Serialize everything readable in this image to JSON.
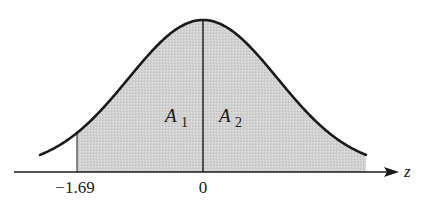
{
  "chart_data": {
    "type": "area",
    "title": "",
    "xlabel": "z",
    "ylabel": "",
    "x_ticks": [
      {
        "value": -1.69,
        "label": "−1.69"
      },
      {
        "value": 0,
        "label": "0"
      }
    ],
    "shaded_from": -1.69,
    "shaded_to": "right tail",
    "divider_at": 0,
    "regions": [
      {
        "name": "A1",
        "label_main": "A",
        "label_sub": "1",
        "from": -1.69,
        "to": 0
      },
      {
        "name": "A2",
        "label_main": "A",
        "label_sub": "2",
        "from": 0,
        "to": "right tail"
      }
    ],
    "axis_arrow": true,
    "grid": false,
    "legend": false,
    "colors": {
      "curve": "#1a1a1a",
      "shade": "#cfcfcf",
      "axis": "#1a1a1a"
    }
  },
  "labels": {
    "tick_left": "−1.69",
    "tick_zero": "0",
    "axis_name": "z",
    "region1_main": "A",
    "region1_sub": "1",
    "region2_main": "A",
    "region2_sub": "2"
  }
}
